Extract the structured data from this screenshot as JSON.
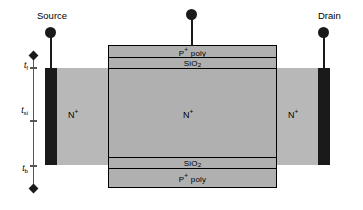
{
  "figure": {
    "type": "semiconductor-cross-section",
    "device": "double-gate SOI MOSFET",
    "background_color": "#ffffff"
  },
  "terminals": [
    {
      "id": "source",
      "label": "Source",
      "marker": "filled-circle-terminal"
    },
    {
      "id": "gate",
      "label": "",
      "marker": "filled-circle-terminal"
    },
    {
      "id": "drain",
      "label": "Drain",
      "marker": "filled-circle-terminal"
    }
  ],
  "stack_layers": {
    "top_gate_electrode": {
      "label": "P",
      "superscript": "+",
      "label_suffix": " poly"
    },
    "top_gate_oxide": {
      "label": "SiO",
      "subscript": "2"
    },
    "bottom_gate_oxide": {
      "label": "SiO",
      "subscript": "2"
    },
    "bottom_gate_electrode": {
      "label": "P",
      "superscript": "+",
      "label_suffix": " poly"
    }
  },
  "regions": [
    {
      "id": "source-region",
      "label": "N",
      "superscript": "+"
    },
    {
      "id": "channel-region",
      "label": "N",
      "superscript": "+"
    },
    {
      "id": "drain-region",
      "label": "N",
      "superscript": "+"
    }
  ],
  "dimensions": [
    {
      "id": "t-front",
      "symbol": "t",
      "subscript": "f",
      "description": "front gate oxide thickness"
    },
    {
      "id": "t-si",
      "symbol": "t",
      "subscript": "si",
      "description": "silicon body thickness"
    },
    {
      "id": "t-back",
      "symbol": "t",
      "subscript": "b",
      "description": "back gate oxide thickness"
    }
  ],
  "colors": {
    "silicon_body": "#b8b8b8",
    "gate_stack": "#b0b0b0",
    "contact_metal": "#1a1a1a",
    "outline": "#000000",
    "dimension_line": "#555555"
  }
}
